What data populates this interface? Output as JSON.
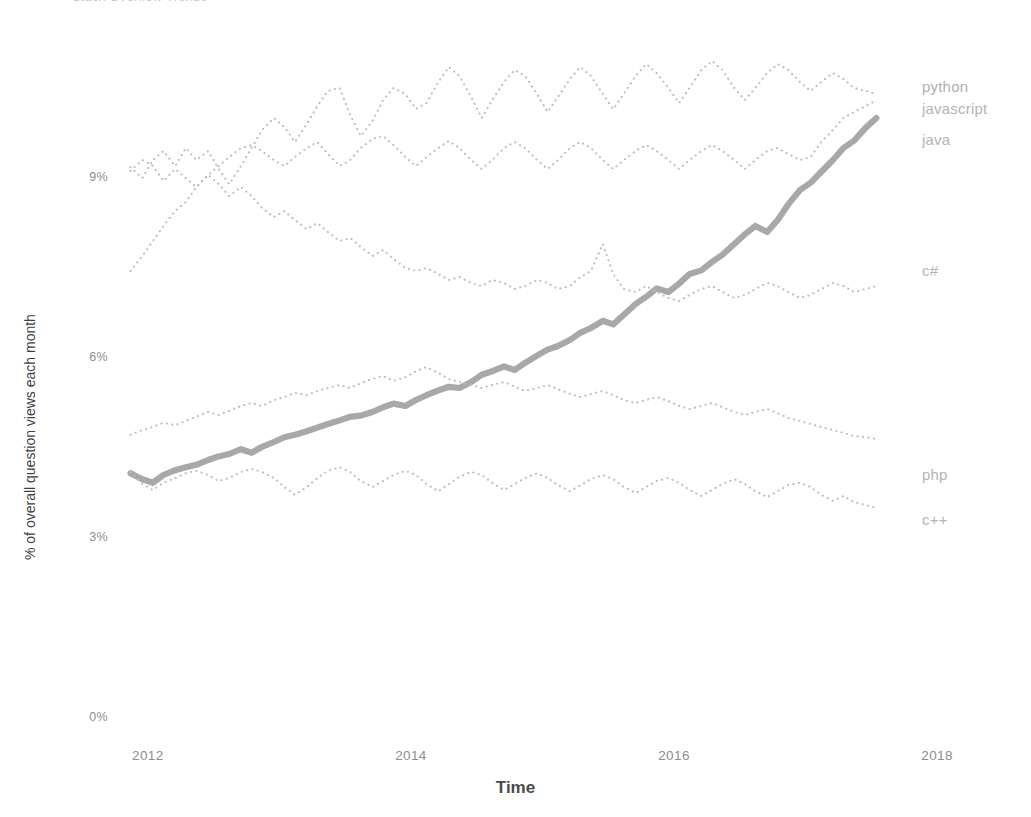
{
  "page": {
    "clipped_header": "Stack Overflow Trends",
    "background_color": "#ffffff"
  },
  "chart_data": {
    "type": "line",
    "title": "",
    "xlabel": "Time",
    "ylabel": "% of overall question views each month",
    "xlim": [
      2011.75,
      2018.25
    ],
    "ylim": [
      0,
      11.2
    ],
    "grid": false,
    "legend_position": "right-inline",
    "x_ticks": [
      "2012",
      "2014",
      "2016",
      "2018"
    ],
    "x_tick_values": [
      2012,
      2014,
      2016,
      2018
    ],
    "y_ticks": [
      "0%",
      "3%",
      "6%",
      "9%"
    ],
    "y_tick_values": [
      0,
      3,
      6,
      9
    ],
    "colors": {
      "python": "#a8a8a8",
      "javascript": "#b9bcc0",
      "java": "#b9bcc0",
      "c_sharp": "#b9bcc0",
      "php": "#b9bcc0",
      "c_plus_plus": "#b9bcc0",
      "axis_text": "#8d8d8d",
      "label_text": "#b4b4b4"
    },
    "x": [
      2011.83,
      2011.92,
      2012.0,
      2012.08,
      2012.17,
      2012.25,
      2012.33,
      2012.42,
      2012.5,
      2012.58,
      2012.67,
      2012.75,
      2012.83,
      2012.92,
      2013.0,
      2013.08,
      2013.17,
      2013.25,
      2013.33,
      2013.42,
      2013.5,
      2013.58,
      2013.67,
      2013.75,
      2013.83,
      2013.92,
      2014.0,
      2014.08,
      2014.17,
      2014.25,
      2014.33,
      2014.42,
      2014.5,
      2014.58,
      2014.67,
      2014.75,
      2014.83,
      2014.92,
      2015.0,
      2015.08,
      2015.17,
      2015.25,
      2015.33,
      2015.42,
      2015.5,
      2015.58,
      2015.67,
      2015.75,
      2015.83,
      2015.92,
      2016.0,
      2016.08,
      2016.17,
      2016.25,
      2016.33,
      2016.42,
      2016.5,
      2016.58,
      2016.67,
      2016.75,
      2016.83,
      2016.92,
      2017.0,
      2017.08,
      2017.17,
      2017.25,
      2017.33,
      2017.42,
      2017.5
    ],
    "series": [
      {
        "name": "python",
        "style": "solid-thick",
        "values": [
          4.08,
          3.98,
          3.92,
          4.05,
          4.13,
          4.18,
          4.22,
          4.3,
          4.36,
          4.4,
          4.48,
          4.42,
          4.52,
          4.6,
          4.68,
          4.72,
          4.78,
          4.84,
          4.9,
          4.96,
          5.02,
          5.04,
          5.1,
          5.18,
          5.24,
          5.2,
          5.3,
          5.38,
          5.46,
          5.52,
          5.5,
          5.6,
          5.72,
          5.78,
          5.86,
          5.8,
          5.92,
          6.04,
          6.14,
          6.2,
          6.3,
          6.42,
          6.5,
          6.62,
          6.56,
          6.72,
          6.9,
          7.02,
          7.16,
          7.1,
          7.24,
          7.4,
          7.46,
          7.6,
          7.72,
          7.9,
          8.06,
          8.2,
          8.1,
          8.3,
          8.56,
          8.8,
          8.92,
          9.1,
          9.3,
          9.5,
          9.62,
          9.84,
          10.0
        ]
      },
      {
        "name": "javascript",
        "style": "dotted",
        "values": [
          9.18,
          9.0,
          9.3,
          9.45,
          9.2,
          9.5,
          9.3,
          9.45,
          9.15,
          8.9,
          9.2,
          9.5,
          9.8,
          10.0,
          9.85,
          9.6,
          9.9,
          10.2,
          10.45,
          10.5,
          10.05,
          9.7,
          9.95,
          10.3,
          10.5,
          10.4,
          10.15,
          10.25,
          10.6,
          10.85,
          10.7,
          10.35,
          10.0,
          10.3,
          10.6,
          10.8,
          10.7,
          10.4,
          10.1,
          10.35,
          10.65,
          10.85,
          10.7,
          10.4,
          10.15,
          10.4,
          10.7,
          10.9,
          10.75,
          10.5,
          10.25,
          10.5,
          10.8,
          10.95,
          10.8,
          10.5,
          10.3,
          10.5,
          10.75,
          10.9,
          10.8,
          10.6,
          10.45,
          10.6,
          10.75,
          10.65,
          10.5,
          10.45,
          10.4
        ]
      },
      {
        "name": "java",
        "style": "dotted",
        "values": [
          7.45,
          7.7,
          7.95,
          8.2,
          8.45,
          8.6,
          8.85,
          9.05,
          9.2,
          9.35,
          9.5,
          9.55,
          9.45,
          9.3,
          9.2,
          9.35,
          9.5,
          9.6,
          9.4,
          9.2,
          9.3,
          9.5,
          9.65,
          9.7,
          9.55,
          9.35,
          9.2,
          9.35,
          9.5,
          9.62,
          9.5,
          9.3,
          9.15,
          9.3,
          9.5,
          9.6,
          9.5,
          9.3,
          9.15,
          9.3,
          9.5,
          9.6,
          9.5,
          9.3,
          9.15,
          9.3,
          9.45,
          9.55,
          9.45,
          9.3,
          9.15,
          9.3,
          9.45,
          9.55,
          9.45,
          9.3,
          9.15,
          9.3,
          9.45,
          9.5,
          9.4,
          9.3,
          9.35,
          9.6,
          9.8,
          10.0,
          10.1,
          10.2,
          10.3
        ]
      },
      {
        "name": "c#",
        "style": "dotted",
        "values": [
          9.12,
          9.3,
          9.2,
          8.95,
          9.15,
          9.0,
          8.85,
          9.05,
          8.9,
          8.7,
          8.85,
          8.7,
          8.5,
          8.35,
          8.45,
          8.3,
          8.15,
          8.25,
          8.1,
          7.95,
          8.0,
          7.85,
          7.7,
          7.8,
          7.65,
          7.5,
          7.45,
          7.5,
          7.4,
          7.3,
          7.35,
          7.25,
          7.2,
          7.3,
          7.25,
          7.15,
          7.2,
          7.3,
          7.25,
          7.15,
          7.2,
          7.35,
          7.45,
          7.9,
          7.4,
          7.15,
          7.1,
          7.2,
          7.1,
          7.0,
          6.95,
          7.05,
          7.15,
          7.2,
          7.1,
          7.0,
          7.05,
          7.15,
          7.25,
          7.2,
          7.1,
          7.0,
          7.05,
          7.15,
          7.25,
          7.2,
          7.1,
          7.15,
          7.2
        ]
      },
      {
        "name": "php",
        "style": "dotted",
        "values": [
          4.72,
          4.8,
          4.85,
          4.92,
          4.88,
          4.95,
          5.02,
          5.1,
          5.05,
          5.12,
          5.2,
          5.25,
          5.2,
          5.3,
          5.35,
          5.42,
          5.38,
          5.45,
          5.5,
          5.55,
          5.5,
          5.58,
          5.65,
          5.7,
          5.62,
          5.68,
          5.78,
          5.85,
          5.75,
          5.65,
          5.6,
          5.55,
          5.5,
          5.55,
          5.6,
          5.52,
          5.45,
          5.5,
          5.55,
          5.48,
          5.4,
          5.35,
          5.4,
          5.45,
          5.38,
          5.3,
          5.25,
          5.3,
          5.35,
          5.28,
          5.2,
          5.15,
          5.2,
          5.25,
          5.18,
          5.1,
          5.05,
          5.1,
          5.15,
          5.08,
          5.0,
          4.95,
          4.9,
          4.85,
          4.8,
          4.75,
          4.7,
          4.68,
          4.65
        ]
      },
      {
        "name": "c++",
        "style": "dotted",
        "values": [
          4.1,
          3.9,
          3.8,
          3.92,
          4.0,
          4.08,
          4.12,
          4.05,
          3.95,
          4.0,
          4.1,
          4.15,
          4.1,
          4.0,
          3.85,
          3.72,
          3.85,
          4.0,
          4.12,
          4.18,
          4.1,
          3.95,
          3.85,
          3.95,
          4.05,
          4.12,
          4.05,
          3.9,
          3.78,
          3.9,
          4.02,
          4.1,
          4.05,
          3.92,
          3.8,
          3.9,
          4.0,
          4.08,
          4.0,
          3.88,
          3.78,
          3.88,
          3.98,
          4.05,
          3.98,
          3.85,
          3.75,
          3.85,
          3.95,
          4.0,
          3.92,
          3.8,
          3.7,
          3.8,
          3.9,
          3.98,
          3.9,
          3.78,
          3.68,
          3.78,
          3.88,
          3.92,
          3.85,
          3.72,
          3.62,
          3.7,
          3.6,
          3.55,
          3.5
        ]
      }
    ],
    "annotations": [
      {
        "label": "python",
        "x": 2017.6,
        "y": 10.0
      },
      {
        "label": "javascript",
        "x": 2017.6,
        "y": 9.6
      },
      {
        "label": "java",
        "x": 2017.6,
        "y": 9.1
      },
      {
        "label": "c#",
        "x": 2017.6,
        "y": 7.1
      },
      {
        "label": "php",
        "x": 2017.6,
        "y": 4.7
      },
      {
        "label": "c++",
        "x": 2017.6,
        "y": 3.9
      }
    ]
  }
}
